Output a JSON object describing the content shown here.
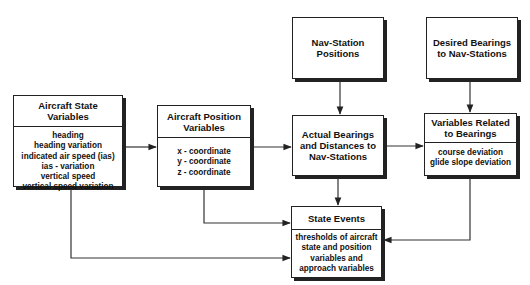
{
  "diagram": {
    "nodes": {
      "aircraft_state": {
        "title": "Aircraft State Variables",
        "title_lines": [
          "Aircraft State",
          "Variables"
        ],
        "items": [
          "heading",
          "heading variation",
          "indicated air speed (ias)",
          "ias - variation",
          "vertical speed",
          "vertical speed variation"
        ]
      },
      "aircraft_position": {
        "title": "Aircraft Position Variables",
        "title_lines": [
          "Aircraft Position",
          "Variables"
        ],
        "items": [
          "x - coordinate",
          "y - coordinate",
          "z - coordinate"
        ]
      },
      "nav_station_positions": {
        "title": "Nav-Station Positions",
        "title_lines": [
          "Nav-Station",
          "Positions"
        ]
      },
      "desired_bearings": {
        "title": "Desired Bearings to Nav-Stations",
        "title_lines": [
          "Desired Bearings",
          "to Nav-Stations"
        ]
      },
      "actual_bearings": {
        "title": "Actual Bearings and Distances to Nav-Stations",
        "title_lines": [
          "Actual Bearings",
          "and Distances to",
          "Nav-Stations"
        ]
      },
      "variables_related": {
        "title": "Variables Related to Bearings",
        "title_lines": [
          "Variables Related",
          "to Bearings"
        ],
        "items": [
          "course deviation",
          "glide slope deviation"
        ]
      },
      "state_events": {
        "title": "State Events",
        "title_lines": [
          "State Events"
        ],
        "description_lines": [
          "thresholds of aircraft",
          "state and position",
          "variables and",
          "approach variables"
        ]
      }
    },
    "edges": [
      {
        "from": "aircraft_state",
        "to": "aircraft_position"
      },
      {
        "from": "aircraft_position",
        "to": "actual_bearings"
      },
      {
        "from": "nav_station_positions",
        "to": "actual_bearings"
      },
      {
        "from": "desired_bearings",
        "to": "variables_related"
      },
      {
        "from": "actual_bearings",
        "to": "variables_related"
      },
      {
        "from": "actual_bearings",
        "to": "state_events"
      },
      {
        "from": "aircraft_position",
        "to": "state_events"
      },
      {
        "from": "aircraft_state",
        "to": "state_events"
      },
      {
        "from": "variables_related",
        "to": "state_events"
      }
    ]
  }
}
